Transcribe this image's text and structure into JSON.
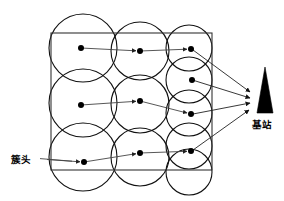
{
  "diagram": {
    "type": "wireless-sensor-network-clustering",
    "background": "#ffffff",
    "width": 284,
    "height": 201,
    "labels": {
      "cluster_head": "簇头",
      "base_station": "基站"
    },
    "colors": {
      "circle_stroke": "#111111",
      "rect_stroke": "#333333",
      "node_fill": "#000000",
      "link_stroke": "#444444",
      "tower_fill": "#000000",
      "background": "#ffffff"
    },
    "field_rect": {
      "x": 51,
      "y": 33,
      "width": 161,
      "height": 137
    },
    "coverage_circles": [
      {
        "cx": 83,
        "cy": 48,
        "r": 34
      },
      {
        "cx": 83,
        "cy": 103,
        "r": 34
      },
      {
        "cx": 83,
        "cy": 157,
        "r": 34
      },
      {
        "cx": 140,
        "cy": 51,
        "r": 29
      },
      {
        "cx": 140,
        "cy": 104,
        "r": 29
      },
      {
        "cx": 140,
        "cy": 157,
        "r": 29
      },
      {
        "cx": 189,
        "cy": 48,
        "r": 23
      },
      {
        "cx": 189,
        "cy": 80,
        "r": 23
      },
      {
        "cx": 189,
        "cy": 113,
        "r": 23
      },
      {
        "cx": 189,
        "cy": 146,
        "r": 23
      },
      {
        "cx": 189,
        "cy": 172,
        "r": 23
      }
    ],
    "nodes": [
      {
        "id": "ch-r1c1",
        "cx": 81,
        "cy": 48,
        "r": 3.0,
        "role": "cluster-head"
      },
      {
        "id": "ch-r1c2",
        "cx": 140,
        "cy": 51,
        "r": 3.0,
        "role": "cluster-head"
      },
      {
        "id": "ch-r1c3",
        "cx": 191,
        "cy": 49,
        "r": 3.0,
        "role": "cluster-head"
      },
      {
        "id": "ch-iso-c3",
        "cx": 192,
        "cy": 80,
        "r": 3.0,
        "role": "cluster-head"
      },
      {
        "id": "ch-r2c1",
        "cx": 81,
        "cy": 105,
        "r": 3.0,
        "role": "cluster-head"
      },
      {
        "id": "ch-r2c2",
        "cx": 140,
        "cy": 101,
        "r": 3.0,
        "role": "cluster-head"
      },
      {
        "id": "ch-r2c3",
        "cx": 191,
        "cy": 114,
        "r": 3.0,
        "role": "cluster-head"
      },
      {
        "id": "ch-r3c1",
        "cx": 84,
        "cy": 162,
        "r": 3.0,
        "role": "cluster-head"
      },
      {
        "id": "ch-r3c2",
        "cx": 140,
        "cy": 153,
        "r": 3.0,
        "role": "cluster-head"
      },
      {
        "id": "ch-r3c3",
        "cx": 191,
        "cy": 151,
        "r": 3.0,
        "role": "cluster-head"
      }
    ],
    "hop_links": [
      {
        "from": [
          81,
          48
        ],
        "to": [
          140,
          51
        ]
      },
      {
        "from": [
          140,
          51
        ],
        "to": [
          191,
          49
        ]
      },
      {
        "from": [
          81,
          105
        ],
        "to": [
          140,
          101
        ]
      },
      {
        "from": [
          140,
          101
        ],
        "to": [
          191,
          114
        ]
      },
      {
        "from": [
          84,
          162
        ],
        "to": [
          140,
          153
        ]
      },
      {
        "from": [
          140,
          153
        ],
        "to": [
          191,
          151
        ]
      }
    ],
    "base_station_links": [
      {
        "from": [
          191,
          49
        ],
        "to": [
          252,
          93
        ]
      },
      {
        "from": [
          192,
          80
        ],
        "to": [
          252,
          99
        ]
      },
      {
        "from": [
          191,
          114
        ],
        "to": [
          252,
          103
        ]
      },
      {
        "from": [
          191,
          151
        ],
        "to": [
          251,
          109
        ]
      }
    ],
    "label_leader": {
      "from": [
        40,
        159
      ],
      "to": [
        81,
        163
      ]
    },
    "tower": {
      "apex": [
        265,
        67
      ],
      "base_left": [
        257,
        113
      ],
      "base_right": [
        273,
        113
      ]
    },
    "label_positions": {
      "cluster_head": {
        "x": 11,
        "y": 163
      },
      "base_station": {
        "x": 252,
        "y": 128
      }
    }
  }
}
